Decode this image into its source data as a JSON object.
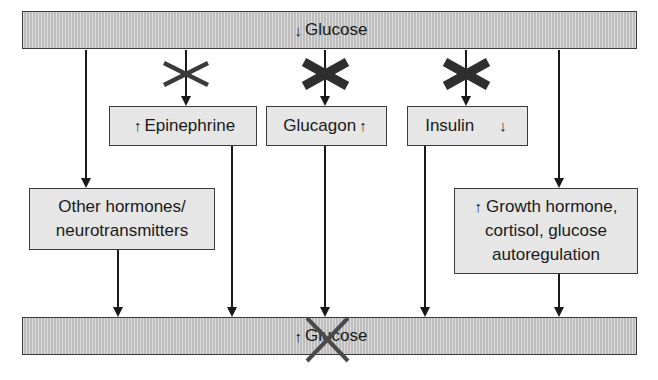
{
  "diagram": {
    "top_bar": {
      "arrow": "↓",
      "label": "Glucose"
    },
    "bottom_bar": {
      "arrow": "↑",
      "label": "Glucose",
      "crossed_out": true
    },
    "boxes": {
      "epinephrine": {
        "arrow": "↑",
        "label": "Epinephrine",
        "blocked": true,
        "block_style": "thin-x"
      },
      "glucagon": {
        "label": "Glucagon",
        "arrow": "↑",
        "blocked": true,
        "block_style": "thick-x"
      },
      "insulin": {
        "label": "Insulin",
        "arrow": "↓",
        "blocked": true,
        "block_style": "thick-x"
      },
      "other": {
        "line1": "Other hormones/",
        "line2": "neurotransmitters"
      },
      "growth": {
        "arrow": "↑",
        "line1": "Growth hormone,",
        "line2": "cortisol, glucose",
        "line3": "autoregulation"
      }
    },
    "colors": {
      "bar_fill": "#c9c9c9",
      "box_fill": "#e6e6e6",
      "line": "#1a1a1a",
      "thick_x": "#2e2e2e",
      "thin_x": "#3a3a3a",
      "bottom_x": "#4a4a4a"
    }
  }
}
